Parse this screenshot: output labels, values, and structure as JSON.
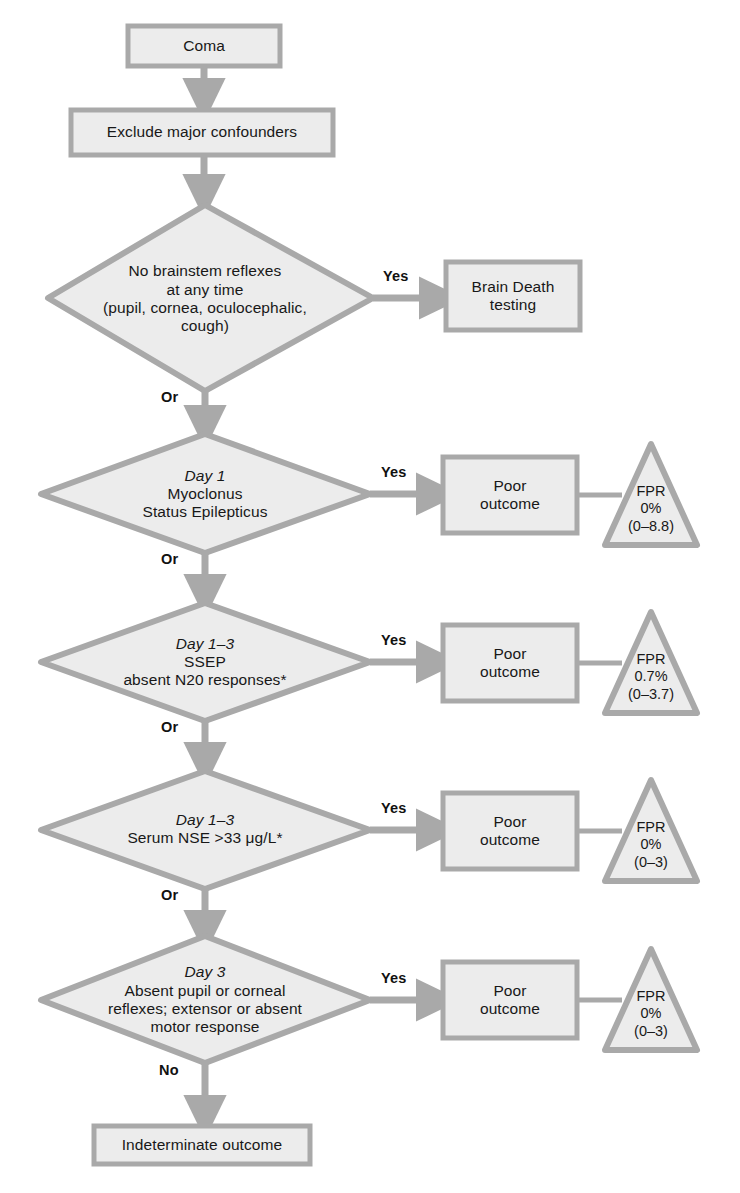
{
  "colors": {
    "shape_fill": "#ececec",
    "shape_stroke": "#a9a9a9",
    "arrow": "#a9a9a9",
    "text": "#181818",
    "background": "#ffffff"
  },
  "flow": {
    "start": {
      "label": "Coma"
    },
    "confounders": {
      "label": "Exclude major confounders"
    },
    "decisions": [
      {
        "id": "brainstem-reflexes",
        "lines": [
          "No brainstem reflexes",
          "at any time",
          "(pupil, cornea, oculocephalic,",
          "cough)"
        ],
        "italic_first_line": false,
        "yes_label": "Yes",
        "next_label": "Or",
        "outcome": "Brain Death testing",
        "outcome_lines": [
          "Brain Death",
          "testing"
        ],
        "fpr": null
      },
      {
        "id": "day1-myoclonus",
        "lines": [
          "Day 1",
          "Myoclonus",
          "Status Epilepticus"
        ],
        "italic_first_line": true,
        "yes_label": "Yes",
        "next_label": "Or",
        "outcome": "Poor outcome",
        "outcome_lines": [
          "Poor",
          "outcome"
        ],
        "fpr": {
          "title": "FPR",
          "value": "0%",
          "ci": "(0–8.8)"
        }
      },
      {
        "id": "day1-3-ssep",
        "lines": [
          "Day 1–3",
          "SSEP",
          "absent N20 responses*"
        ],
        "italic_first_line": true,
        "yes_label": "Yes",
        "next_label": "Or",
        "outcome": "Poor outcome",
        "outcome_lines": [
          "Poor",
          "outcome"
        ],
        "fpr": {
          "title": "FPR",
          "value": "0.7%",
          "ci": "(0–3.7)"
        }
      },
      {
        "id": "day1-3-nse",
        "lines": [
          "Day 1–3",
          "Serum NSE >33 μg/L*"
        ],
        "italic_first_line": true,
        "yes_label": "Yes",
        "next_label": "Or",
        "outcome": "Poor outcome",
        "outcome_lines": [
          "Poor",
          "outcome"
        ],
        "fpr": {
          "title": "FPR",
          "value": "0%",
          "ci": "(0–3)"
        }
      },
      {
        "id": "day3-reflexes-motor",
        "lines": [
          "Day 3",
          "Absent pupil or corneal",
          "reflexes; extensor or absent",
          "motor response"
        ],
        "italic_first_line": true,
        "yes_label": "Yes",
        "next_label": "No",
        "outcome": "Poor outcome",
        "outcome_lines": [
          "Poor",
          "outcome"
        ],
        "fpr": {
          "title": "FPR",
          "value": "0%",
          "ci": "(0–3)"
        }
      }
    ],
    "end": {
      "label": "Indeterminate outcome"
    }
  }
}
